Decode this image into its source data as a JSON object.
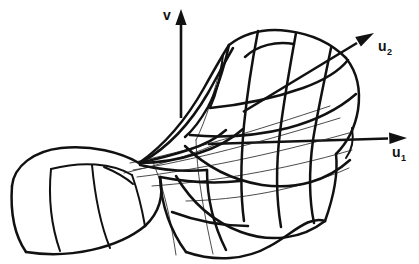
{
  "figure": {
    "type": "line-diagram",
    "background_color": "#ffffff",
    "stroke_color": "#111111",
    "hairline_color": "#2a2a2a",
    "width": 419,
    "height": 264
  },
  "axes": {
    "vertical": {
      "label": "v",
      "subscript": "",
      "name": "v-axis",
      "label_x": 163,
      "label_y": 19,
      "from": [
        181,
        118
      ],
      "to": [
        181,
        14
      ],
      "direction": "up"
    },
    "horizontal": {
      "label": "u",
      "subscript": "1",
      "name": "u1-axis",
      "label_x": 396,
      "label_y": 155,
      "from": [
        208,
        144
      ],
      "to": [
        407,
        138
      ],
      "direction": "right"
    },
    "diagonal": {
      "label": "u",
      "subscript": "2",
      "name": "u2-axis",
      "label_x": 382,
      "label_y": 49,
      "from": [
        243,
        112
      ],
      "to": [
        374,
        33
      ],
      "direction": "up-right"
    }
  },
  "surface": {
    "description": "Folded pleat surface with upper sheet, lower sheet and a cusp line, drawn as a curvilinear mesh",
    "bold_line_count": 22,
    "hairline_count": 9,
    "mesh_u_lines": 5,
    "mesh_v_lines": 5
  }
}
